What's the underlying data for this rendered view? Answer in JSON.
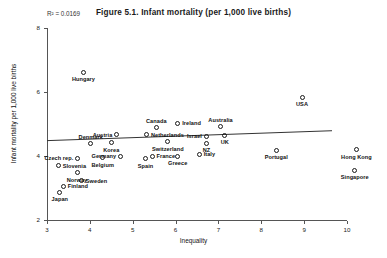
{
  "chart_data": {
    "type": "scatter",
    "title": "Figure 5.1. Infant mortality (per 1,000 live births)",
    "xlabel": "Inequality",
    "ylabel": "Infant mortality per 1,000 live births",
    "annotation": "R² = 0.0169",
    "r_squared": 0.0169,
    "xlim": [
      3,
      10
    ],
    "ylim": [
      2,
      8
    ],
    "xticks": [
      3,
      4,
      5,
      6,
      7,
      8,
      9,
      10
    ],
    "xtick_labels": [
      "3",
      "4",
      "5",
      "6",
      "7",
      "8",
      "9",
      "10"
    ],
    "yticks": [
      2,
      4,
      6,
      8
    ],
    "ytick_labels": [
      "2",
      "4",
      "6",
      "8"
    ],
    "grid": false,
    "legend": "none",
    "marker": "open-circle",
    "trendline": {
      "type": "linear",
      "x_start": 3.0,
      "y_start": 4.48,
      "x_end": 9.65,
      "y_end": 4.79
    },
    "points": [
      {
        "label": "Hungary",
        "x": 3.85,
        "y": 6.62,
        "label_pos": "below"
      },
      {
        "label": "USA",
        "x": 8.95,
        "y": 5.83,
        "label_pos": "below"
      },
      {
        "label": "Ireland",
        "x": 6.05,
        "y": 5.03,
        "label_pos": "right"
      },
      {
        "label": "Canada",
        "x": 5.55,
        "y": 4.88,
        "label_pos": "above"
      },
      {
        "label": "Australia",
        "x": 7.05,
        "y": 4.92,
        "label_pos": "above"
      },
      {
        "label": "Austria",
        "x": 4.63,
        "y": 4.67,
        "label_pos": "left"
      },
      {
        "label": "Netherlands",
        "x": 5.32,
        "y": 4.67,
        "label_pos": "right"
      },
      {
        "label": "Israel",
        "x": 6.72,
        "y": 4.62,
        "label_pos": "left"
      },
      {
        "label": "UK",
        "x": 7.15,
        "y": 4.65,
        "label_pos": "below"
      },
      {
        "label": "NZ",
        "x": 6.72,
        "y": 4.4,
        "label_pos": "below"
      },
      {
        "label": "Switzerland",
        "x": 5.82,
        "y": 4.45,
        "label_pos": "below"
      },
      {
        "label": "Korea",
        "x": 4.5,
        "y": 4.42,
        "label_pos": "below"
      },
      {
        "label": "Denmark",
        "x": 4.02,
        "y": 4.38,
        "label_pos": "above"
      },
      {
        "label": "Portugal",
        "x": 8.35,
        "y": 4.18,
        "label_pos": "below"
      },
      {
        "label": "Italy",
        "x": 6.55,
        "y": 4.05,
        "label_pos": "right"
      },
      {
        "label": "France",
        "x": 5.45,
        "y": 4.0,
        "label_pos": "right"
      },
      {
        "label": "Germany",
        "x": 4.72,
        "y": 4.0,
        "label_pos": "left"
      },
      {
        "label": "Spain",
        "x": 5.3,
        "y": 3.92,
        "label_pos": "below"
      },
      {
        "label": "Greece",
        "x": 6.05,
        "y": 4.0,
        "label_pos": "below"
      },
      {
        "label": "Belgium",
        "x": 4.3,
        "y": 3.95,
        "label_pos": "below"
      },
      {
        "label": "Czech rep.",
        "x": 3.72,
        "y": 3.93,
        "label_pos": "left"
      },
      {
        "label": "Slovenia",
        "x": 3.26,
        "y": 3.7,
        "label_pos": "right"
      },
      {
        "label": "Norway",
        "x": 3.7,
        "y": 3.48,
        "label_pos": "below"
      },
      {
        "label": "Sweden",
        "x": 3.8,
        "y": 3.22,
        "label_pos": "right"
      },
      {
        "label": "Finland",
        "x": 3.38,
        "y": 3.05,
        "label_pos": "right"
      },
      {
        "label": "Japan",
        "x": 3.3,
        "y": 2.87,
        "label_pos": "below"
      },
      {
        "label": "Hong Kong",
        "x": 10.22,
        "y": 4.2,
        "label_pos": "below"
      },
      {
        "label": "Singapore",
        "x": 10.18,
        "y": 3.55,
        "label_pos": "below"
      }
    ]
  }
}
